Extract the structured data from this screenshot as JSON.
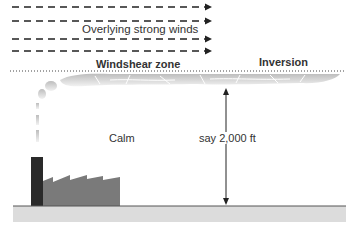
{
  "diagram": {
    "labels": {
      "winds": "Overlying strong winds",
      "windshear": "Windshear zone",
      "inversion": "Inversion",
      "calm": "Calm",
      "height": "say 2,000 ft"
    },
    "colors": {
      "arrows": "#222222",
      "chimney": "#2a2a2a",
      "factory": "#7a7a7a",
      "ground": "#dcdcdc",
      "ground_line": "#555555",
      "smoke": "#c8c8c8",
      "inversion_line": "#444444"
    }
  }
}
